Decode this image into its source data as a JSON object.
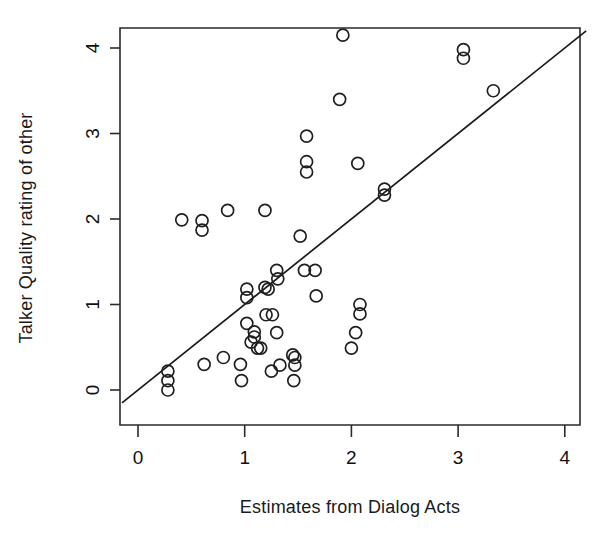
{
  "chart_data": {
    "type": "scatter",
    "title": "",
    "xlabel": "Estimates from Dialog Acts",
    "ylabel": "Talker Quality rating of other",
    "xlim": [
      -0.15,
      4.2
    ],
    "ylim": [
      -0.18,
      4.2
    ],
    "xticks": [
      0,
      1,
      2,
      3,
      4
    ],
    "yticks": [
      0,
      1,
      2,
      3,
      4
    ],
    "xtick_labels": [
      "0",
      "1",
      "2",
      "3",
      "4"
    ],
    "ytick_labels": [
      "0",
      "1",
      "2",
      "3",
      "4"
    ],
    "grid": false,
    "legend": false,
    "reference_line": {
      "name": "identity-line",
      "type": "line",
      "slope": 1,
      "intercept": 0,
      "x_start": -0.15,
      "x_end": 4.2,
      "color": "#1a1a1a"
    },
    "marker": {
      "shape": "open-circle",
      "radius_px": 6,
      "color": "#1f1f1f",
      "fill": "none"
    },
    "points": [
      [
        0.28,
        0.22
      ],
      [
        0.28,
        0.11
      ],
      [
        0.28,
        0.0
      ],
      [
        0.41,
        1.99
      ],
      [
        0.6,
        1.98
      ],
      [
        0.6,
        1.87
      ],
      [
        0.62,
        0.3
      ],
      [
        0.84,
        2.1
      ],
      [
        0.8,
        0.38
      ],
      [
        0.96,
        0.3
      ],
      [
        0.97,
        0.11
      ],
      [
        1.02,
        0.78
      ],
      [
        1.02,
        1.18
      ],
      [
        1.02,
        1.08
      ],
      [
        1.09,
        0.68
      ],
      [
        1.09,
        0.62
      ],
      [
        1.06,
        0.56
      ],
      [
        1.12,
        0.49
      ],
      [
        1.15,
        0.49
      ],
      [
        1.19,
        2.1
      ],
      [
        1.19,
        1.2
      ],
      [
        1.22,
        1.18
      ],
      [
        1.2,
        0.88
      ],
      [
        1.26,
        0.88
      ],
      [
        1.3,
        1.4
      ],
      [
        1.31,
        1.3
      ],
      [
        1.3,
        0.67
      ],
      [
        1.25,
        0.22
      ],
      [
        1.33,
        0.29
      ],
      [
        1.45,
        0.41
      ],
      [
        1.47,
        0.38
      ],
      [
        1.47,
        0.29
      ],
      [
        1.46,
        0.11
      ],
      [
        1.52,
        1.8
      ],
      [
        1.56,
        1.4
      ],
      [
        1.66,
        1.4
      ],
      [
        1.58,
        2.97
      ],
      [
        1.58,
        2.67
      ],
      [
        1.58,
        2.55
      ],
      [
        1.67,
        1.1
      ],
      [
        1.92,
        4.15
      ],
      [
        1.89,
        3.4
      ],
      [
        2.0,
        0.49
      ],
      [
        2.06,
        2.65
      ],
      [
        2.08,
        1.0
      ],
      [
        2.08,
        0.89
      ],
      [
        2.04,
        0.67
      ],
      [
        2.31,
        2.35
      ],
      [
        2.31,
        2.28
      ],
      [
        3.05,
        3.98
      ],
      [
        3.05,
        3.88
      ],
      [
        3.33,
        3.5
      ]
    ]
  },
  "axes_geometry": {
    "plot_left_px": 120,
    "plot_right_px": 580,
    "plot_top_px": 28,
    "plot_bottom_px": 425,
    "x_zero_px": 138,
    "x_unit_px": 106.7,
    "y_zero_px": 390,
    "y_unit_px": 85.5
  }
}
